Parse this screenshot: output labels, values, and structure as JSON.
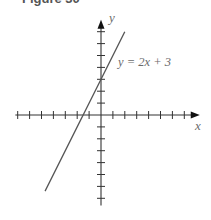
{
  "figure": {
    "title": "Figure 30"
  },
  "chart_data": {
    "type": "line",
    "title": "Figure 30",
    "xlabel": "x",
    "ylabel": "y",
    "series": [
      {
        "name": "y = 2x + 3",
        "equation": "y = 2x + 3",
        "slope": 2,
        "intercept": 3,
        "x": [
          -4.7,
          2.0
        ],
        "y": [
          -6.4,
          7.0
        ]
      }
    ],
    "annotations": [
      {
        "text": "y = 2x + 3",
        "near": [
          2.2,
          4.5
        ]
      }
    ],
    "xlim": [
      -7.2,
      8.3
    ],
    "ylim": [
      -7.6,
      8.0
    ],
    "x_ticks": [
      -7,
      -6,
      -5,
      -4,
      -3,
      -2,
      -1,
      1,
      2,
      3,
      4,
      5,
      6,
      7
    ],
    "y_ticks": [
      -7,
      -6,
      -5,
      -4,
      -3,
      -2,
      -1,
      1,
      2,
      3,
      4,
      5,
      6,
      7
    ],
    "tick_labels_shown": false,
    "grid": false,
    "legend": "none",
    "colors": {
      "axis": "#333333",
      "line": "#555555",
      "label": "#6b6b6b"
    }
  }
}
